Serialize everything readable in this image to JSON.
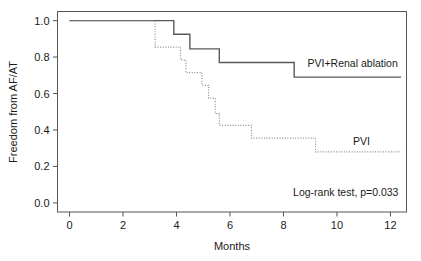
{
  "chart_data": {
    "type": "line",
    "title": "",
    "subtitle": "",
    "xlabel": "Months",
    "ylabel": "Freedom from AF/AT",
    "xlim": [
      -0.45,
      12.6
    ],
    "ylim": [
      -0.05,
      1.05
    ],
    "xticks": [
      0,
      2,
      4,
      6,
      8,
      10,
      12
    ],
    "xtick_labels": [
      "0",
      "2",
      "4",
      "6",
      "8",
      "10",
      "12"
    ],
    "yticks": [
      0.0,
      0.2,
      0.4,
      0.6,
      0.8,
      1.0
    ],
    "ytick_labels": [
      "0.0",
      "0.2",
      "0.4",
      "0.6",
      "0.8",
      "1.0"
    ],
    "grid": false,
    "legend_position": "inline-right-of-curves",
    "annotations": [
      {
        "name": "log-rank-annotation",
        "text": "Log-rank test, p=0.033",
        "x": 12.3,
        "y": 0.04,
        "anchor": "end"
      }
    ],
    "series": [
      {
        "name": "PVI+Renal ablation",
        "style": "solid",
        "color": "#5a5a5a",
        "label_x": 8.9,
        "label_y": 0.745,
        "x": [
          0.0,
          3.9,
          3.9,
          4.5,
          4.5,
          5.6,
          5.6,
          8.4,
          8.4,
          12.4
        ],
        "y": [
          1.0,
          1.0,
          0.925,
          0.925,
          0.845,
          0.845,
          0.77,
          0.77,
          0.69,
          0.69
        ],
        "steps": [
          {
            "month": 0.0,
            "value": 1.0
          },
          {
            "month": 3.9,
            "value": 0.925
          },
          {
            "month": 4.5,
            "value": 0.845
          },
          {
            "month": 5.6,
            "value": 0.77
          },
          {
            "month": 8.4,
            "value": 0.69
          },
          {
            "month": 12.4,
            "value": 0.69
          }
        ]
      },
      {
        "name": "PVI",
        "style": "dotted",
        "color": "#8a8a8a",
        "label_x": 10.6,
        "label_y": 0.315,
        "x": [
          0.0,
          3.2,
          3.2,
          4.15,
          4.15,
          4.35,
          4.35,
          4.95,
          4.95,
          5.2,
          5.2,
          5.45,
          5.45,
          5.6,
          5.6,
          6.8,
          6.8,
          9.2,
          9.2,
          12.4
        ],
        "y": [
          1.0,
          1.0,
          0.855,
          0.855,
          0.785,
          0.785,
          0.715,
          0.715,
          0.645,
          0.645,
          0.575,
          0.575,
          0.49,
          0.49,
          0.425,
          0.425,
          0.355,
          0.355,
          0.28,
          0.28
        ],
        "steps": [
          {
            "month": 0.0,
            "value": 1.0
          },
          {
            "month": 3.2,
            "value": 0.855
          },
          {
            "month": 4.15,
            "value": 0.785
          },
          {
            "month": 4.35,
            "value": 0.715
          },
          {
            "month": 4.95,
            "value": 0.645
          },
          {
            "month": 5.2,
            "value": 0.575
          },
          {
            "month": 5.45,
            "value": 0.49
          },
          {
            "month": 5.6,
            "value": 0.425
          },
          {
            "month": 6.8,
            "value": 0.355
          },
          {
            "month": 9.2,
            "value": 0.28
          },
          {
            "month": 12.4,
            "value": 0.28
          }
        ]
      }
    ]
  }
}
